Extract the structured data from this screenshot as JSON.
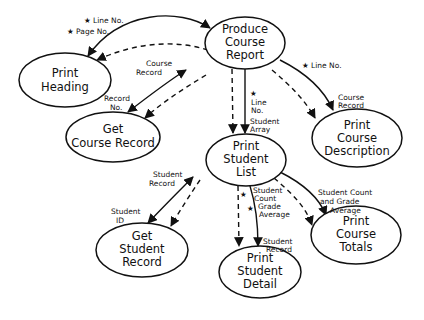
{
  "diagram": {
    "type": "structure chart",
    "nodes": [
      {
        "id": "produce",
        "lines": [
          "Produce",
          "Course",
          "Report"
        ],
        "cx": 245,
        "cy": 43,
        "rx": 40,
        "ry": 26
      },
      {
        "id": "heading",
        "lines": [
          "Print",
          "Heading"
        ],
        "cx": 65,
        "cy": 80,
        "rx": 46,
        "ry": 27
      },
      {
        "id": "getcourse",
        "lines": [
          "Get",
          "Course Record"
        ],
        "cx": 113,
        "cy": 137,
        "rx": 47,
        "ry": 25
      },
      {
        "id": "description",
        "lines": [
          "Print",
          "Course",
          "Description"
        ],
        "cx": 357,
        "cy": 138,
        "rx": 45,
        "ry": 29
      },
      {
        "id": "studentlist",
        "lines": [
          "Print",
          "Student",
          "List"
        ],
        "cx": 246,
        "cy": 160,
        "rx": 40,
        "ry": 26
      },
      {
        "id": "getstudent",
        "lines": [
          "Get",
          "Student",
          "Record"
        ],
        "cx": 142,
        "cy": 250,
        "rx": 46,
        "ry": 27
      },
      {
        "id": "detail",
        "lines": [
          "Print",
          "Student",
          "Detail"
        ],
        "cx": 260,
        "cy": 272,
        "rx": 41,
        "ry": 26
      },
      {
        "id": "totals",
        "lines": [
          "Print",
          "Course",
          "Totals"
        ],
        "cx": 356,
        "cy": 235,
        "rx": 45,
        "ry": 29
      }
    ],
    "labels": [
      {
        "id": "line-no-heading",
        "text": "★ Line No.",
        "x": 84,
        "y": 23
      },
      {
        "id": "page-no",
        "text": "★ Page No.",
        "x": 67,
        "y": 34
      },
      {
        "id": "course-record-getcourse",
        "lines": [
          "Course",
          "Record"
        ],
        "x": 146,
        "y": 63
      },
      {
        "id": "record-no",
        "lines": [
          "Record",
          "No."
        ],
        "x": 104,
        "y": 99
      },
      {
        "id": "line-no-description",
        "text": "★ Line No.",
        "x": 302,
        "y": 68
      },
      {
        "id": "course-record-description",
        "lines": [
          "Course",
          "Record"
        ],
        "x": 338,
        "y": 100
      },
      {
        "id": "line-no-studentlist",
        "lines": [
          "★",
          "Line",
          "No."
        ],
        "x": 251,
        "y": 94
      },
      {
        "id": "student-array",
        "lines": [
          "Student",
          "Array"
        ],
        "x": 250,
        "y": 123
      },
      {
        "id": "student-record-getstudent",
        "lines": [
          "Student",
          "Record"
        ],
        "x": 152,
        "y": 177
      },
      {
        "id": "student-id",
        "lines": [
          "Student",
          "ID"
        ],
        "x": 111,
        "y": 213
      },
      {
        "id": "star-detail",
        "text": "★",
        "x": 240,
        "y": 196
      },
      {
        "id": "student-count-grade",
        "lines": [
          "Student",
          "Count",
          "Grade",
          "Average"
        ],
        "x": 251,
        "y": 192
      },
      {
        "id": "star-detail-2",
        "text": "★",
        "x": 246,
        "y": 213
      },
      {
        "id": "student-record-detail",
        "lines": [
          "Student",
          "Record"
        ],
        "x": 263,
        "y": 244
      },
      {
        "id": "student-count-totals",
        "lines": [
          "Student Count",
          "and Grade",
          "Average"
        ],
        "x": 318,
        "y": 195
      }
    ]
  }
}
